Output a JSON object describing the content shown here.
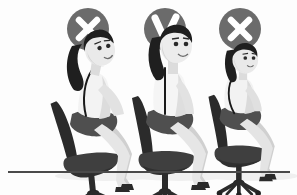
{
  "illustration": {
    "title": "Sitting posture comparison",
    "subject": "office-worker-posture",
    "style": "flat grayscale cartoon",
    "background_color": "#fdfdfd",
    "floor_line_color": "#4a4a4a",
    "figure_count": 3
  },
  "palette": {
    "badge_circle": "#6b6b6b",
    "badge_mark": "#ffffff",
    "hair_dark": "#1f1f1f",
    "skin_light": "#e8e8e8",
    "skin_shadow": "#cfcfcf",
    "blouse_white": "#f5f5f5",
    "skirt_dark": "#4f4f4f",
    "chair_dark": "#2b2b2b",
    "chair_seat": "#3f3f3f",
    "leg_gray": "#dcdcdc",
    "shoe_dark": "#2b2b2b",
    "shadow_gray": "#ececec",
    "outline": "#111111"
  },
  "badges": [
    {
      "id": "badge-left",
      "icon": "cross-icon",
      "mark": "X",
      "meaning": "incorrect",
      "label": "Wrong posture",
      "cx": 88,
      "cy": 29,
      "r": 21
    },
    {
      "id": "badge-center",
      "icon": "check-icon",
      "mark": "V",
      "meaning": "correct",
      "label": "Correct posture",
      "cx": 165,
      "cy": 29,
      "r": 21
    },
    {
      "id": "badge-right",
      "icon": "cross-icon",
      "mark": "X",
      "meaning": "incorrect",
      "label": "Wrong posture",
      "cx": 240,
      "cy": 29,
      "r": 21
    }
  ],
  "figures": [
    {
      "id": "figure-left",
      "posture": "leaning-back",
      "description": "Woman leaning backward against chair, head tilted up, spine arched back",
      "badge": "cross-icon",
      "origin_x": 62,
      "scale": 1.0
    },
    {
      "id": "figure-center",
      "posture": "upright",
      "description": "Woman sitting upright with straight spine, neutral neck",
      "badge": "check-icon",
      "origin_x": 138,
      "scale": 1.0
    },
    {
      "id": "figure-right",
      "posture": "slouching-forward",
      "description": "Woman hunched forward away from backrest, rounded shoulders",
      "badge": "cross-icon",
      "origin_x": 214,
      "scale": 0.92
    }
  ],
  "chair": {
    "name": "office-chair",
    "parts": [
      "backrest",
      "seat",
      "gas-cylinder",
      "five-star-base",
      "casters"
    ],
    "color": "#2b2b2b"
  },
  "floor": {
    "y": 172,
    "x_start": 8,
    "x_end": 290,
    "thickness": 2
  }
}
